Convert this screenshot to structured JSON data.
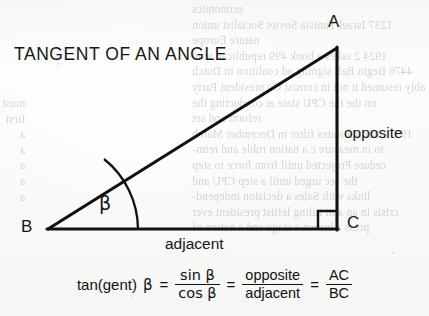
{
  "figure": {
    "title": "TANGENT OF AN ANGLE",
    "vertices": {
      "a": "A",
      "b": "B",
      "c": "C"
    },
    "angle_label": "β",
    "side_labels": {
      "opposite": "opposite",
      "adjacent": "adjacent"
    },
    "right_angle_marker": "right-angle-square"
  },
  "formula": {
    "lhs": "tan(gent)",
    "lhs_angle": "β",
    "equals_1": "=",
    "fraction_1": {
      "numerator": "sin β",
      "denominator": "cos β"
    },
    "equals_2": "=",
    "fraction_2": {
      "numerator": "opposite",
      "denominator": "adjacent"
    },
    "equals_3": "=",
    "fraction_3": {
      "numerator": "AC",
      "denominator": "BC"
    }
  },
  "background": {
    "description": "faint show-through text from reverse page",
    "right_column_lines": [
      "economics",
      "1237 Israel Tunisia Soviet Socialist union",
      "nature Europe",
      "1924 2 sakes a book 499 republican won",
      "4476   Begin Ball signing ad coalition in Dutch",
      "ably resumed it not in consist Co president Party",
      "on the the CPU   state at conducting the",
      "reform and set",
      "1991 national states filter in December  March",
      "to   in   measure c   a   nation  ruble and reim-",
      "cedure Projected until from   force to step",
      "the sec urged until  a      step   CPU   and",
      "links   with  Sales  a   decision  independ-",
      "crisis in an anti   ruling   leftist president  ever",
      "press   a brown   a stage   and  a nation   of"
    ],
    "left_column_lines": [
      "must",
      "first",
      "a",
      "a",
      "a",
      "a",
      "a"
    ]
  },
  "colors": {
    "paper": "#fbfbfa",
    "ink": "#16161a",
    "ghost_text": "#7c7b76",
    "line": "#111111"
  }
}
